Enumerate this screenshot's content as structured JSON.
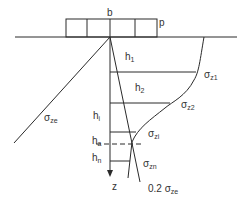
{
  "diagram": {
    "title_width_label": "b",
    "load_label": "p",
    "depth_axis_label": "z",
    "layers": [
      {
        "h": "h",
        "h_sub": "1"
      },
      {
        "h": "h",
        "h_sub": "2"
      },
      {
        "h": "h",
        "h_sub": "i"
      },
      {
        "h": "h",
        "h_sub": "a"
      },
      {
        "h": "h",
        "h_sub": "n"
      }
    ],
    "stress_labels": [
      {
        "sym": "σ",
        "sub": "z1"
      },
      {
        "sym": "σ",
        "sub": "z2"
      },
      {
        "sym": "σ",
        "sub": "zi"
      },
      {
        "sym": "σ",
        "sub": "zn"
      }
    ],
    "self_weight_label": {
      "sym": "σ",
      "sub": "ze"
    },
    "limit_label": {
      "prefix": "0.2 ",
      "sym": "σ",
      "sub": "ze"
    },
    "colors": {
      "line": "#2a2a2a",
      "text": "#333333",
      "background": "#ffffff"
    }
  }
}
